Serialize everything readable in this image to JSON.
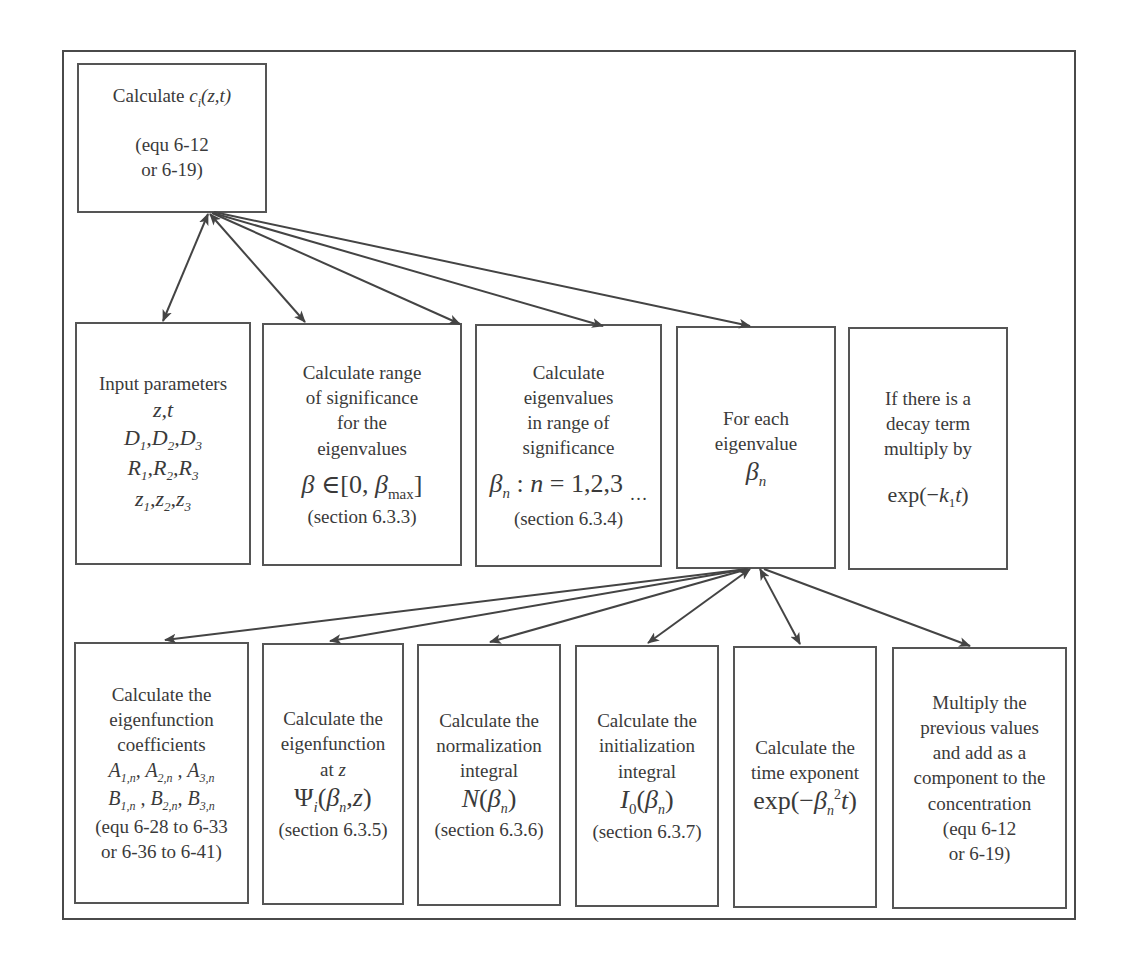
{
  "top_box": {
    "title": "Calculate ci(z,t)",
    "ref_line1": "(equ 6-12",
    "ref_line2": "or 6-19)"
  },
  "middle_row": [
    {
      "id": "input-parameters",
      "lines": [
        "Input parameters"
      ],
      "math": [
        "z,t",
        "D1,D2,D3",
        "R1,R2,R3",
        "z1,z2,z3"
      ]
    },
    {
      "id": "range-of-significance",
      "lines": [
        "Calculate range",
        "of significance",
        "for the",
        "eigenvalues"
      ],
      "math": [
        "β∈[0, βmax]"
      ],
      "ref": "(section 6.3.3)"
    },
    {
      "id": "eigenvalues",
      "lines": [
        "Calculate",
        "eigenvalues",
        "in range of",
        "significance"
      ],
      "math": [
        "βn : n = 1,2,3 …"
      ],
      "ref": "(section 6.3.4)"
    },
    {
      "id": "for-each-eigenvalue",
      "lines": [
        "For each",
        "eigenvalue"
      ],
      "math": [
        "βn"
      ]
    },
    {
      "id": "decay-term",
      "lines": [
        "If there is a",
        "decay term",
        "multiply by"
      ],
      "math": [
        "exp(−k1t)"
      ]
    }
  ],
  "bottom_row": [
    {
      "id": "eigenfunction-coefficients",
      "lines": [
        "Calculate the",
        "eigenfunction",
        "coefficients"
      ],
      "math": [
        "A1,n, A2,n , A3,n",
        "B1,n , B2,n, B3,n"
      ],
      "ref_lines": [
        "(equ 6-28 to 6-33",
        "or 6-36 to 6-41)"
      ]
    },
    {
      "id": "eigenfunction-at-z",
      "lines": [
        "Calculate the",
        "eigenfunction",
        "at z"
      ],
      "math": [
        "Ψi(βn, z)"
      ],
      "ref_lines": [
        "(section 6.3.5)"
      ]
    },
    {
      "id": "normalization-integral",
      "lines": [
        "Calculate the",
        "normalization",
        "integral"
      ],
      "math": [
        "N(βn)"
      ],
      "ref_lines": [
        "(section 6.3.6)"
      ]
    },
    {
      "id": "initialization-integral",
      "lines": [
        "Calculate the",
        "initialization",
        "integral"
      ],
      "math": [
        "I0(βn)"
      ],
      "ref_lines": [
        "(section 6.3.7)"
      ]
    },
    {
      "id": "time-exponent",
      "lines": [
        "Calculate the",
        "time exponent"
      ],
      "math": [
        "exp(−βn²t)"
      ],
      "ref_lines": []
    },
    {
      "id": "multiply-and-add",
      "lines": [
        "Multiply the",
        "previous values",
        "and add as a",
        "component to the",
        "concentration"
      ],
      "math": [],
      "ref_lines": [
        "(equ 6-12",
        "or 6-19)"
      ]
    }
  ],
  "colors": {
    "line": "#4a4a4a",
    "text": "#3a3a3a",
    "background": "#ffffff"
  }
}
